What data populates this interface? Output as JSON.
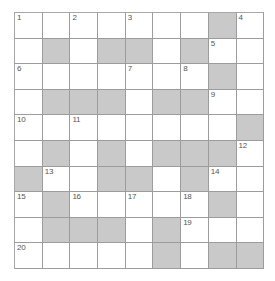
{
  "puzzle": {
    "type": "crossword-grid",
    "columns": 9,
    "rows": 10,
    "colors": {
      "cell_blank": "#ffffff",
      "cell_shaded": "#c9c9c9",
      "grid_line": "#9c9c9c",
      "number_text": "#555555",
      "page_background": "#ffffff"
    },
    "numbered_cells": [
      {
        "number": "1",
        "row": 1,
        "col": 1
      },
      {
        "number": "2",
        "row": 1,
        "col": 3
      },
      {
        "number": "3",
        "row": 1,
        "col": 5
      },
      {
        "number": "4",
        "row": 1,
        "col": 9
      },
      {
        "number": "5",
        "row": 2,
        "col": 8
      },
      {
        "number": "6",
        "row": 3,
        "col": 1
      },
      {
        "number": "7",
        "row": 3,
        "col": 5
      },
      {
        "number": "8",
        "row": 3,
        "col": 7
      },
      {
        "number": "9",
        "row": 4,
        "col": 8
      },
      {
        "number": "10",
        "row": 5,
        "col": 1
      },
      {
        "number": "11",
        "row": 5,
        "col": 3
      },
      {
        "number": "12",
        "row": 6,
        "col": 9
      },
      {
        "number": "13",
        "row": 7,
        "col": 2
      },
      {
        "number": "14",
        "row": 7,
        "col": 8
      },
      {
        "number": "15",
        "row": 8,
        "col": 1
      },
      {
        "number": "16",
        "row": 8,
        "col": 3
      },
      {
        "number": "17",
        "row": 8,
        "col": 5
      },
      {
        "number": "18",
        "row": 8,
        "col": 7
      },
      {
        "number": "19",
        "row": 9,
        "col": 7
      },
      {
        "number": "20",
        "row": 10,
        "col": 1
      }
    ],
    "shaded_cells": [
      {
        "row": 1,
        "col": 8
      },
      {
        "row": 2,
        "col": 2
      },
      {
        "row": 2,
        "col": 4
      },
      {
        "row": 2,
        "col": 5
      },
      {
        "row": 2,
        "col": 7
      },
      {
        "row": 3,
        "col": 8
      },
      {
        "row": 4,
        "col": 2
      },
      {
        "row": 4,
        "col": 3
      },
      {
        "row": 4,
        "col": 4
      },
      {
        "row": 4,
        "col": 6
      },
      {
        "row": 4,
        "col": 7
      },
      {
        "row": 5,
        "col": 9
      },
      {
        "row": 6,
        "col": 2
      },
      {
        "row": 6,
        "col": 4
      },
      {
        "row": 6,
        "col": 6
      },
      {
        "row": 6,
        "col": 7
      },
      {
        "row": 6,
        "col": 8
      },
      {
        "row": 7,
        "col": 1
      },
      {
        "row": 7,
        "col": 4
      },
      {
        "row": 7,
        "col": 5
      },
      {
        "row": 7,
        "col": 7
      },
      {
        "row": 8,
        "col": 2
      },
      {
        "row": 8,
        "col": 8
      },
      {
        "row": 9,
        "col": 2
      },
      {
        "row": 9,
        "col": 3
      },
      {
        "row": 9,
        "col": 4
      },
      {
        "row": 9,
        "col": 6
      },
      {
        "row": 10,
        "col": 6
      },
      {
        "row": 10,
        "col": 8
      },
      {
        "row": 10,
        "col": 9
      }
    ]
  }
}
